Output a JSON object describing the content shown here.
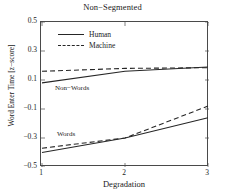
{
  "chart_data": {
    "type": "line",
    "title": "Non−Segmented",
    "xlabel": "Degradation",
    "ylabel": "Word Enter Time [z−score]",
    "x": [
      1,
      2,
      3
    ],
    "xtick_labels": [
      "1",
      "2",
      "3"
    ],
    "ytick_labels": [
      "0.5",
      "0.3",
      "0.1",
      "−0.1",
      "−0.3",
      "−0.5"
    ],
    "ytick_values": [
      0.5,
      0.3,
      0.1,
      -0.1,
      -0.3,
      -0.5
    ],
    "xlim": [
      1,
      3
    ],
    "ylim": [
      -0.5,
      0.5
    ],
    "grid": false,
    "legend_position": "upper-left-inside",
    "series": [
      {
        "name": "Non-Words Human",
        "group": "Non−Words",
        "condition": "Human",
        "style": "solid",
        "color": "#262626",
        "values": [
          0.08,
          0.16,
          0.19
        ]
      },
      {
        "name": "Non-Words Machine",
        "group": "Non−Words",
        "condition": "Machine",
        "style": "dashed",
        "color": "#262626",
        "values": [
          0.16,
          0.18,
          0.185
        ]
      },
      {
        "name": "Words Human",
        "group": "Words",
        "condition": "Human",
        "style": "solid",
        "color": "#262626",
        "values": [
          -0.4,
          -0.3,
          -0.16
        ]
      },
      {
        "name": "Words Machine",
        "group": "Words",
        "condition": "Machine",
        "style": "dashed",
        "color": "#262626",
        "values": [
          -0.37,
          -0.3,
          -0.08
        ]
      }
    ],
    "annotations": [
      {
        "text": "Non−Words",
        "x": 1.15,
        "y": 0.03
      },
      {
        "text": "Words",
        "x": 1.2,
        "y": -0.27
      }
    ],
    "legend": [
      {
        "label": "Human",
        "style": "solid"
      },
      {
        "label": "Machine",
        "style": "dashed"
      }
    ]
  }
}
